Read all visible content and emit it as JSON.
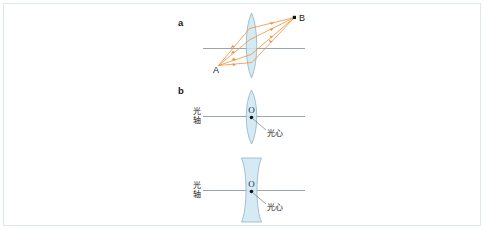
{
  "figure": {
    "panels": [
      {
        "letter": "a",
        "type": "converging-lens-imaging",
        "point_labels": [
          {
            "name": "A",
            "text": "A",
            "role": "object-point"
          },
          {
            "name": "B",
            "text": "B",
            "role": "image-point"
          }
        ],
        "lens_kind": "biconvex",
        "ray_color": "#f0913c",
        "ray_count": 3
      },
      {
        "letter": "b",
        "type": "optical-center-convex",
        "lens_kind": "biconvex",
        "center_mark": "O",
        "axis_label": "光轴",
        "axis_label_chars": [
          "光",
          "轴"
        ],
        "center_label": "光心"
      },
      {
        "letter": "",
        "type": "optical-center-concave",
        "lens_kind": "biconcave",
        "center_mark": "O",
        "axis_label": "光轴",
        "axis_label_chars": [
          "光",
          "轴"
        ],
        "center_label": "光心"
      }
    ],
    "colors": {
      "lens_fill": "#cfe6f2",
      "lens_stroke": "#8fb4c8",
      "ray": "#f0913c",
      "axis": "#6f7f88",
      "border": "#dde8ec",
      "text": "#1a1a1a"
    }
  }
}
